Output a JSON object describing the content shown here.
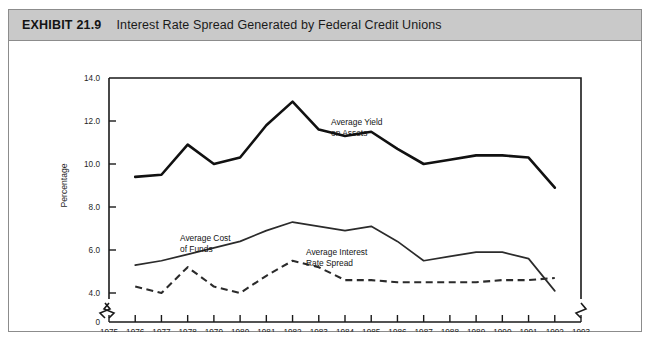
{
  "exhibit": {
    "number": "EXHIBIT 21.9",
    "title": "Interest Rate Spread Generated by Federal Credit Unions",
    "header_bg": "#c9c9c9",
    "frame_color": "#8c8c8c"
  },
  "chart_data": {
    "type": "line",
    "title": "Interest Rate Spread Generated by Federal Credit Unions",
    "xlabel": "Year",
    "ylabel": "Percentage",
    "xlim": [
      1975,
      1993
    ],
    "ylim": [
      4.0,
      14.0
    ],
    "y_axis_break": true,
    "y_zero_label": "0",
    "grid": false,
    "legend": "inline-annotations",
    "xticks": [
      1975,
      1976,
      1977,
      1978,
      1979,
      1980,
      1981,
      1982,
      1983,
      1984,
      1985,
      1986,
      1987,
      1988,
      1989,
      1990,
      1991,
      1992,
      1993
    ],
    "xtick_labels": [
      "1975",
      "1976",
      "1977",
      "1978",
      "1979",
      "1980",
      "1981",
      "1982",
      "1983",
      "1984",
      "1985",
      "1986",
      "1987",
      "1988",
      "1989",
      "1990",
      "1991",
      "1992",
      "1993"
    ],
    "yticks": [
      4.0,
      6.0,
      8.0,
      10.0,
      12.0,
      14.0
    ],
    "ytick_labels": [
      "4.0",
      "6.0",
      "8.0",
      "10.0",
      "12.0",
      "14.0"
    ],
    "x": [
      1976,
      1977,
      1978,
      1979,
      1980,
      1981,
      1982,
      1983,
      1984,
      1985,
      1986,
      1987,
      1988,
      1989,
      1990,
      1991,
      1992
    ],
    "series": [
      {
        "name": "Average Yield on Assets",
        "style": "solid-thick",
        "color": "#111111",
        "values": [
          9.4,
          9.5,
          10.9,
          10.0,
          10.3,
          11.8,
          12.9,
          11.6,
          11.3,
          11.5,
          10.7,
          10.0,
          10.2,
          10.4,
          10.4,
          10.3,
          8.9
        ]
      },
      {
        "name": "Average Cost of Funds",
        "style": "solid-thin",
        "color": "#2b2b2b",
        "values": [
          5.3,
          5.5,
          5.8,
          6.1,
          6.4,
          6.9,
          7.3,
          7.1,
          6.9,
          7.1,
          6.4,
          5.5,
          5.7,
          5.9,
          5.9,
          5.6,
          4.1
        ]
      },
      {
        "name": "Average Interest Rate Spread",
        "style": "dashed",
        "color": "#2b2b2b",
        "values": [
          4.3,
          4.0,
          5.2,
          4.3,
          4.0,
          4.8,
          5.5,
          5.2,
          4.6,
          4.6,
          4.5,
          4.5,
          4.5,
          4.5,
          4.6,
          4.6,
          4.7
        ]
      }
    ],
    "annotations": [
      {
        "text_line1": "Average Yield",
        "text_line2": "on Assets",
        "series": "Average Yield on Assets"
      },
      {
        "text_line1": "Average Cost",
        "text_line2": "of Funds",
        "series": "Average Cost of Funds"
      },
      {
        "text_line1": "Average Interest",
        "text_line2": "Rate Spread",
        "series": "Average Interest Rate Spread"
      }
    ]
  }
}
